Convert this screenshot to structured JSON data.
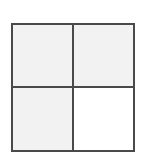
{
  "diagram": {
    "type": "2x2 grid",
    "rows": 2,
    "columns": 2,
    "line_color": "#4a4a4a",
    "cells": [
      {
        "position": "top-left",
        "shaded": true,
        "fill": "#f2f2f2"
      },
      {
        "position": "top-right",
        "shaded": true,
        "fill": "#f2f2f2"
      },
      {
        "position": "bottom-left",
        "shaded": true,
        "fill": "#f2f2f2"
      },
      {
        "position": "bottom-right",
        "shaded": false,
        "fill": "#ffffff"
      }
    ],
    "shaded_count": 3,
    "total_count": 4
  }
}
